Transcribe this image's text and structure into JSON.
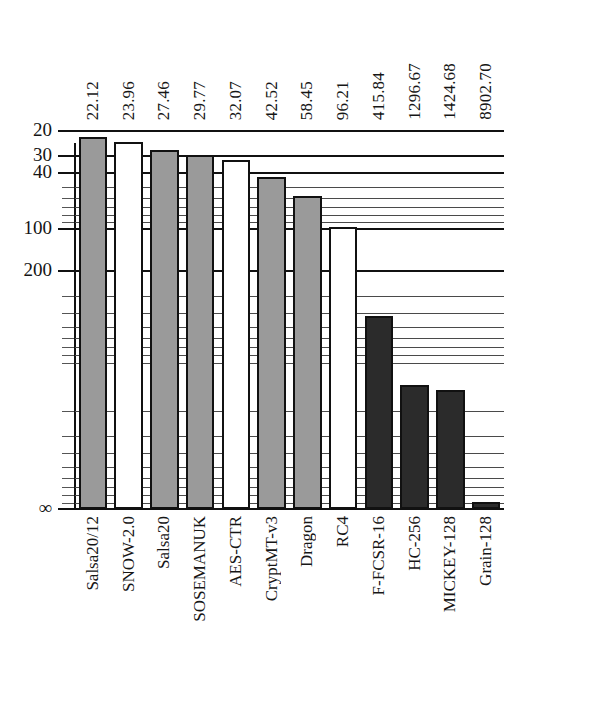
{
  "chart_data": {
    "type": "bar",
    "title": "",
    "xlabel": "",
    "ylabel": "",
    "orientation": "vertical",
    "y_axis_inverted": true,
    "y_scale": "log",
    "grid": true,
    "legend_position": "none",
    "y_tick_labels": [
      "20",
      "30",
      "40",
      "100",
      "200",
      "∞"
    ],
    "y_tick_values": [
      20,
      30,
      40,
      100,
      200,
      10000
    ],
    "ylim": [
      20,
      10000
    ],
    "categories": [
      "Salsa20/12",
      "SNOW-2.0",
      "Salsa20",
      "SOSEMANUK",
      "AES-CTR",
      "CryptMT-v3",
      "Dragon",
      "RC4",
      "F-FCSR-16",
      "HC-256",
      "MICKEY-128",
      "Grain-128"
    ],
    "values": [
      22.12,
      23.96,
      27.46,
      29.77,
      32.07,
      42.52,
      58.45,
      96.21,
      415.84,
      1296.67,
      1424.68,
      8902.7
    ],
    "value_labels": [
      "22.12",
      "23.96",
      "27.46",
      "29.77",
      "32.07",
      "42.52",
      "58.45",
      "96.21",
      "415.84",
      "1296.67",
      "1424.68",
      "8902.70"
    ],
    "bar_fills": [
      "gray",
      "white",
      "gray",
      "gray",
      "white",
      "gray",
      "gray",
      "white",
      "dark",
      "dark",
      "dark",
      "dark"
    ],
    "colors": {
      "gray": "#9a9a9a",
      "white": "#ffffff",
      "dark": "#2b2b2b",
      "outline": "#111111",
      "gridline": "#4a4a4a",
      "gridline_major": "#111111",
      "text": "#161616",
      "background": "#ffffff"
    }
  }
}
